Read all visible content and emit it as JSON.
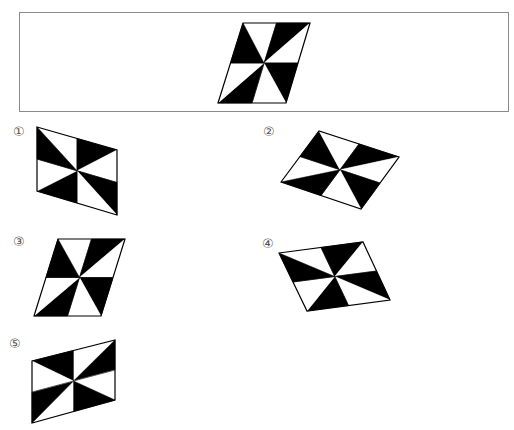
{
  "question": {
    "reference_figure": {
      "name": "reference-parallelogram",
      "vertices": {
        "TL": [
          243,
          23
        ],
        "TR": [
          310,
          23
        ],
        "BR": [
          286,
          103
        ],
        "BL": [
          218,
          103
        ]
      },
      "center": [
        264,
        63
      ],
      "shading": [
        "white",
        "black",
        "white",
        "black",
        "white",
        "black",
        "white",
        "black"
      ]
    },
    "frame": {
      "x": 19,
      "y": 12,
      "width": 490,
      "height": 100
    }
  },
  "options": [
    {
      "label": "①",
      "label_pos": [
        13,
        125
      ],
      "vertices": {
        "TL": [
          37,
          127
        ],
        "TR": [
          117,
          150
        ],
        "BR": [
          117,
          215
        ],
        "BL": [
          37,
          191
        ]
      },
      "shading": [
        "white",
        "black",
        "white",
        "black",
        "white",
        "black",
        "white",
        "black"
      ]
    },
    {
      "label": "②",
      "label_pos": [
        263,
        125
      ],
      "vertices": {
        "TL": [
          281,
          182
        ],
        "TR": [
          319,
          131
        ],
        "BR": [
          399,
          157
        ],
        "BL": [
          361,
          209
        ]
      },
      "shading": [
        "white",
        "black",
        "white",
        "black",
        "white",
        "black",
        "white",
        "black"
      ]
    },
    {
      "label": "③",
      "label_pos": [
        13,
        235
      ],
      "vertices": {
        "TL": [
          58,
          239
        ],
        "TR": [
          125,
          239
        ],
        "BR": [
          101,
          316
        ],
        "BL": [
          34,
          316
        ]
      },
      "shading": [
        "white",
        "black",
        "white",
        "black",
        "white",
        "black",
        "white",
        "black"
      ]
    },
    {
      "label": "④",
      "label_pos": [
        262,
        237
      ],
      "vertices": {
        "TL": [
          279,
          253
        ],
        "TR": [
          363,
          242
        ],
        "BR": [
          390,
          300
        ],
        "BL": [
          307,
          311
        ]
      },
      "shading": [
        "white",
        "black",
        "white",
        "black",
        "white",
        "black",
        "white",
        "black"
      ]
    },
    {
      "label": "⑤",
      "label_pos": [
        9,
        337
      ],
      "vertices": {
        "TL": [
          32,
          361
        ],
        "TR": [
          115,
          340
        ],
        "BR": [
          115,
          400
        ],
        "BL": [
          32,
          423
        ]
      },
      "shading": [
        "black",
        "white",
        "black",
        "white",
        "black",
        "white",
        "black",
        "white"
      ]
    }
  ],
  "colors": {
    "fill_black": "#000000",
    "fill_white": "#ffffff",
    "stroke": "#000000",
    "frame_border": "#8a8a8a",
    "label_color": "#555555"
  }
}
